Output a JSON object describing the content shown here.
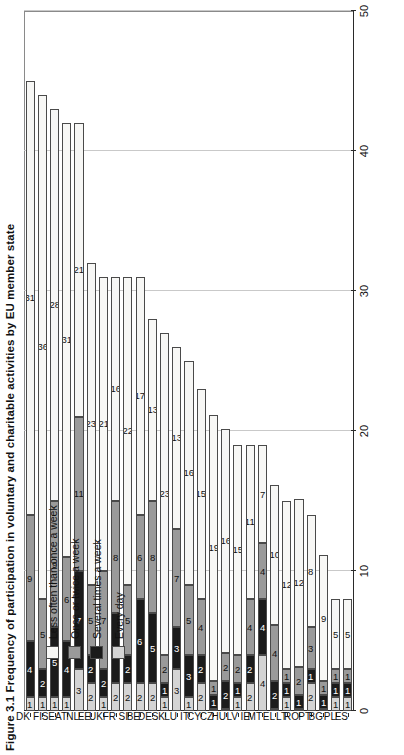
{
  "figure": {
    "title": "Figure 3.1 Frequency of participation in voluntary and charitable activities by EU member state",
    "title_short": "Figure 3.1"
  },
  "legend": {
    "position": "top-left-inside",
    "items": [
      {
        "key": "lessoften",
        "label": "Less often than once a week",
        "color": "#f7f7f5"
      },
      {
        "key": "oncetwice",
        "label": "Once or twice a week",
        "color": "#9a9a9a"
      },
      {
        "key": "several",
        "label": "Several times a week",
        "color": "#1b1b1b"
      },
      {
        "key": "everyday",
        "label": "Every day",
        "color": "#d4d4d4"
      }
    ]
  },
  "axis": {
    "value_ticks": [
      "0",
      "10",
      "20",
      "30",
      "40",
      "50"
    ],
    "value_min": 0,
    "value_max": 50,
    "grid": true
  },
  "chart_data": {
    "type": "bar",
    "orientation": "horizontal-stacked",
    "title": "Figure 3.1 Frequency of participation in voluntary and charitable activities by EU member state",
    "xlabel": "",
    "ylabel": "",
    "ylim": [
      0,
      50
    ],
    "grid": true,
    "legend_position": "top-left-inside",
    "categories": [
      "DK",
      "FI",
      "SE",
      "AT",
      "NL",
      "EE",
      "UK",
      "FR",
      "SI",
      "BE",
      "DE",
      "SK",
      "LU",
      "IT",
      "CY",
      "CZ",
      "HU",
      "LV",
      "IE",
      "MT",
      "EL",
      "LT",
      "RO",
      "PT",
      "BG",
      "PL",
      "ES"
    ],
    "series": [
      {
        "name": "Every day",
        "key": "everyday",
        "color": "#d4d4d4",
        "values": [
          1,
          1,
          1,
          1,
          3,
          2,
          1,
          2,
          2,
          2,
          2,
          1,
          3,
          1,
          2,
          0,
          0,
          1,
          2,
          4,
          0,
          1,
          0,
          2,
          0,
          1,
          1
        ]
      },
      {
        "name": "Several times a week",
        "key": "several",
        "color": "#1b1b1b",
        "values": [
          4,
          2,
          5,
          4,
          7,
          2,
          2,
          5,
          2,
          6,
          5,
          1,
          3,
          3,
          2,
          1,
          2,
          1,
          2,
          4,
          2,
          1,
          1,
          1,
          1,
          1,
          1
        ]
      },
      {
        "name": "Once or twice a week",
        "key": "oncetwice",
        "color": "#9a9a9a",
        "values": [
          9,
          5,
          9,
          6,
          11,
          5,
          7,
          8,
          5,
          6,
          8,
          2,
          7,
          5,
          4,
          1,
          2,
          2,
          4,
          4,
          4,
          1,
          2,
          3,
          1,
          1,
          1
        ]
      },
      {
        "name": "Less often than once a week",
        "key": "lessoften",
        "color": "#f7f7f5",
        "values": [
          31,
          36,
          28,
          31,
          21,
          23,
          21,
          16,
          22,
          17,
          13,
          23,
          13,
          16,
          15,
          19,
          16,
          15,
          11,
          7,
          10,
          12,
          12,
          8,
          9,
          5,
          5
        ]
      }
    ]
  }
}
